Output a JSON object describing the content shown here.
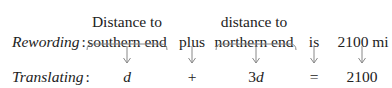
{
  "rewording": {
    "label": "Rewording",
    "colon": ":",
    "items": [
      {
        "line1": "Distance to",
        "line2": "southern end"
      },
      {
        "line1": "",
        "line2": "plus"
      },
      {
        "line1": "distance to",
        "line2": "northern end"
      },
      {
        "line1": "",
        "line2": "is"
      },
      {
        "line1": "",
        "line2": "2100 mi"
      }
    ]
  },
  "translating": {
    "label": "Translating",
    "colon": ":",
    "items": [
      {
        "var": "d"
      },
      {
        "text": "+"
      },
      {
        "coef": "3",
        "var": "d"
      },
      {
        "text": "="
      },
      {
        "text": "2100"
      }
    ]
  }
}
